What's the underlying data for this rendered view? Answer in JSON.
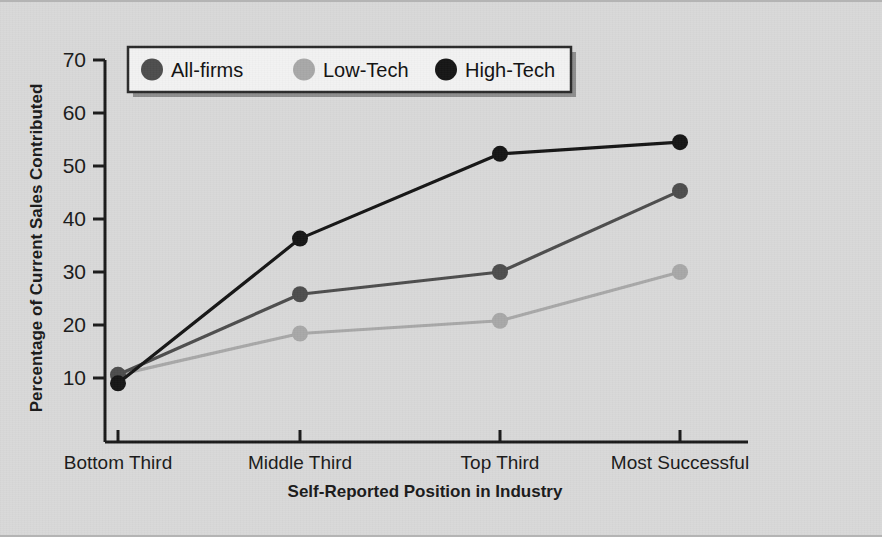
{
  "chart_data": {
    "type": "line",
    "title": "",
    "xlabel": "Self-Reported Position in Industry",
    "ylabel": "Percentage of Current Sales Contributed",
    "categories": [
      "Bottom Third",
      "Middle Third",
      "Top Third",
      "Most Successful"
    ],
    "yticks": [
      10,
      20,
      30,
      40,
      50,
      60,
      70
    ],
    "ylim": [
      4,
      70
    ],
    "grid": false,
    "legend_position": "top-left-inside",
    "series": [
      {
        "name": "All-firms",
        "color": "#4d4d4d",
        "values": [
          10.6,
          25.8,
          30.0,
          45.3
        ]
      },
      {
        "name": "Low-Tech",
        "color": "#a8a8a8",
        "values": [
          10.6,
          18.4,
          20.8,
          30.0
        ]
      },
      {
        "name": "High-Tech",
        "color": "#151515",
        "values": [
          9.0,
          36.3,
          52.3,
          54.5
        ]
      }
    ]
  },
  "figure": {
    "background_color": "#d9d9d9",
    "axis_color": "#1a1a1a"
  }
}
